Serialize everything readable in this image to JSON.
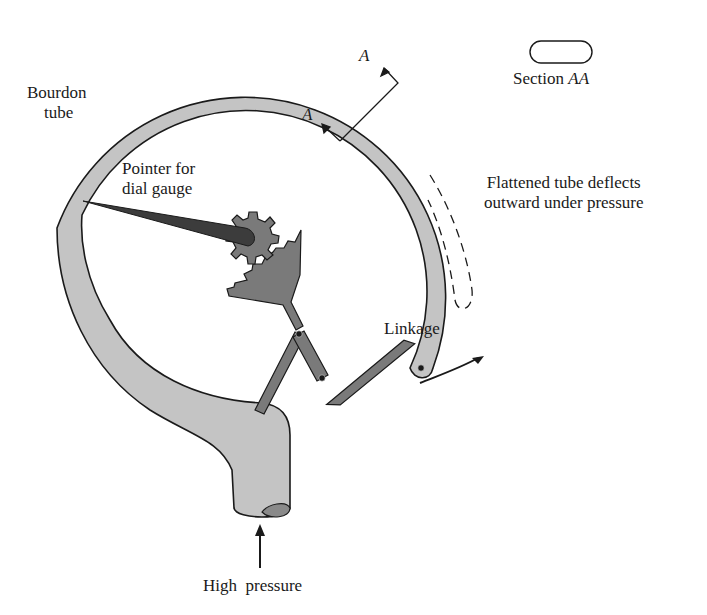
{
  "diagram": {
    "labels": {
      "bourdon_tube_line1": "Bourdon",
      "bourdon_tube_line2": "tube",
      "pointer_line1": "Pointer for",
      "pointer_line2": "dial gauge",
      "section_marker_top": "A",
      "section_marker_bottom": "A",
      "section_label_prefix": "Section ",
      "section_label_italic": "AA",
      "deflect_line1": "Flattened tube deflects",
      "deflect_line2": "outward under pressure",
      "linkage": "Linkage",
      "high_pressure": "High  pressure"
    },
    "components": [
      "bourdon-tube",
      "pointer",
      "pinion-gear",
      "toothed-sector",
      "linkage",
      "pressure-inlet",
      "section-AA-cross-section",
      "deflected-tube-outline"
    ],
    "colors": {
      "tube_fill": "#c4c4c4",
      "mechanism_fill": "#7a7a7a",
      "pointer_fill": "#3c3c3c",
      "stroke": "#1a1a1a",
      "background": "#ffffff"
    }
  }
}
